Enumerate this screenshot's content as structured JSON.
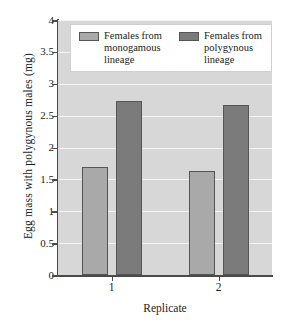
{
  "chart_data": {
    "type": "bar",
    "title": "",
    "xlabel": "Replicate",
    "ylabel": "Egg mass with polygynous males (mg)",
    "categories": [
      "1",
      "2"
    ],
    "series": [
      {
        "name": "Females from monogamous lineage",
        "values": [
          1.7,
          1.63
        ],
        "color": "#a9a9a9"
      },
      {
        "name": "Females from polygynous lineage",
        "values": [
          2.73,
          2.67
        ],
        "color": "#7b7b7b"
      }
    ],
    "ylim": [
      0,
      4
    ],
    "ytick_labels": [
      "0",
      "0.5",
      "1",
      "1.5",
      "2",
      "2.5",
      "3",
      "3.5",
      "4"
    ],
    "ytick_values": [
      0,
      0.5,
      1,
      1.5,
      2,
      2.5,
      3,
      3.5,
      4
    ],
    "grid": true,
    "grid_axis": "y",
    "grid_color": "#f4f4f4",
    "legend_position": "top-inside",
    "plot_background": "#d7d7d7",
    "axis_color": "#4a4a4a",
    "bar_edge_color": "#555555"
  },
  "legend": {
    "entries": [
      {
        "label": "Females from\nmonogamous\nlineage",
        "swatch": "light"
      },
      {
        "label": "Females from\npolygynous\nlineage",
        "swatch": "dark"
      }
    ]
  }
}
